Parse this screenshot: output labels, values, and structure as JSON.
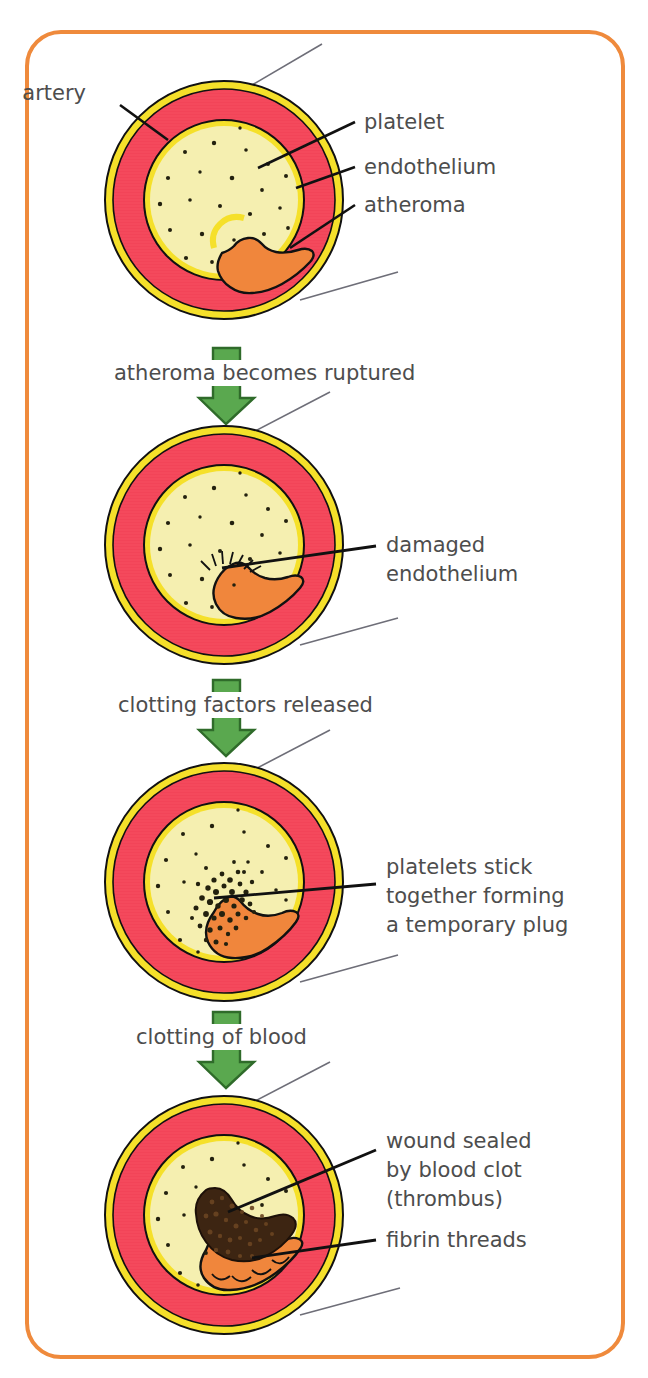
{
  "figure": {
    "border_color": "#ef8a3c",
    "background": "#ffffff"
  },
  "palette": {
    "artery_wall_red": "#f4495c",
    "outer_ring_yellow": "#f5e02a",
    "lumen_yellow": "#f5efb0",
    "atheroma_orange": "#f0863c",
    "clot_dark": "#3d2512",
    "arrow_green": "#5aa84f",
    "arrow_green_edge": "#2f6b2a",
    "leader_line": "#1a1a1a",
    "cutaway_line": "#6e6e78",
    "text_gray": "#4d4d4d",
    "outline_black": "#111111"
  },
  "panels": [
    {
      "id": "panel-1",
      "name": "artery-with-atheroma",
      "labels": [
        {
          "key": "artery",
          "text": "artery"
        },
        {
          "key": "platelet",
          "text": "platelet"
        },
        {
          "key": "endothelium",
          "text": "endothelium"
        },
        {
          "key": "atheroma",
          "text": "atheroma"
        }
      ]
    },
    {
      "id": "panel-2",
      "name": "ruptured-atheroma",
      "labels": [
        {
          "key": "damaged-endothelium",
          "lines": [
            "damaged",
            "endothelium"
          ]
        }
      ]
    },
    {
      "id": "panel-3",
      "name": "platelet-plug",
      "labels": [
        {
          "key": "platelet-plug",
          "lines": [
            "platelets stick",
            "together forming",
            "a temporary plug"
          ]
        }
      ]
    },
    {
      "id": "panel-4",
      "name": "thrombus",
      "labels": [
        {
          "key": "wound-sealed",
          "lines": [
            "wound sealed",
            "by blood clot",
            "(thrombus)"
          ]
        },
        {
          "key": "fibrin-threads",
          "lines": [
            "fibrin threads"
          ]
        }
      ]
    }
  ],
  "steps": [
    {
      "id": "step-1",
      "text": "atheroma becomes ruptured"
    },
    {
      "id": "step-2",
      "text": "clotting factors released"
    },
    {
      "id": "step-3",
      "text": "clotting of blood"
    }
  ]
}
